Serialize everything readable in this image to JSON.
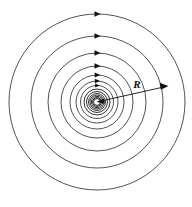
{
  "figure": {
    "type": "physics-field-diagram",
    "title": "",
    "background_color": "#ffffff",
    "line_color": "#1a1a1a",
    "width": 192,
    "height": 207
  },
  "center": {
    "x": 97,
    "y": 102,
    "label": ""
  },
  "field_lines": {
    "description": "concentric circular field lines",
    "count": 14,
    "radii": [
      88,
      66,
      49,
      36,
      27,
      21,
      16.5,
      13,
      10.5,
      8.5,
      7,
      5.6,
      4.4,
      3.4
    ],
    "direction": "counterclockwise",
    "arrow_head_angle_deg": -90
  },
  "arrow_heads": {
    "count": 7,
    "on_radii": [
      88,
      66,
      49,
      36,
      27,
      21,
      16.5
    ],
    "marker": "triangle-right"
  },
  "radius_arrow": {
    "label": "R",
    "from": {
      "x": 97,
      "y": 102
    },
    "to": {
      "x": 168,
      "y": 86
    },
    "angle_deg": 13,
    "head": "arrow-right",
    "double_ended": true
  },
  "annotations": [
    {
      "name": "radius-label",
      "text": "R",
      "x": 137,
      "y": 88
    }
  ]
}
